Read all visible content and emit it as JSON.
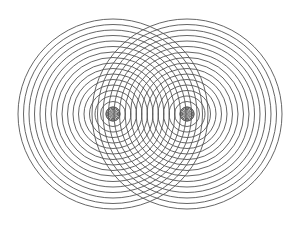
{
  "diagram": {
    "type": "concentric-circles-interference",
    "background": "#ffffff",
    "stroke_color": "#555555",
    "centers": [
      {
        "name": "left-source",
        "cx": 113,
        "cy": 114
      },
      {
        "name": "right-source",
        "cx": 187,
        "cy": 114
      }
    ],
    "max_radius": 95,
    "ring_spacing": 5.5,
    "min_radius": 2
  }
}
